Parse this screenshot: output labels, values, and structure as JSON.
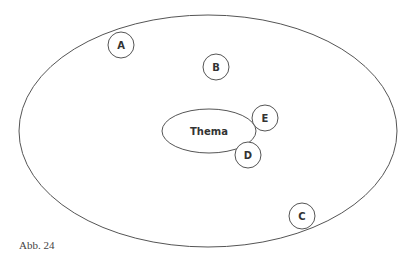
{
  "diagram": {
    "center_label": "Thema",
    "nodes": [
      {
        "id": "A",
        "label": "A"
      },
      {
        "id": "B",
        "label": "B"
      },
      {
        "id": "C",
        "label": "C"
      },
      {
        "id": "D",
        "label": "D"
      },
      {
        "id": "E",
        "label": "E"
      }
    ],
    "stroke_color": "#555555"
  },
  "caption": "Abb. 24"
}
